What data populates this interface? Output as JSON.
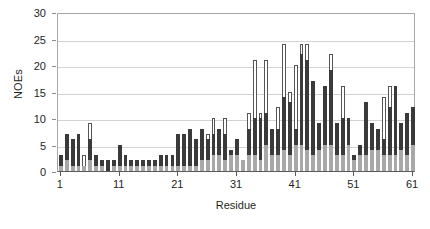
{
  "chart_data": {
    "type": "bar",
    "subtype": "stacked-bar",
    "title": "",
    "xlabel": "Residue",
    "ylabel": "NOEs",
    "xlim": [
      0.5,
      61.5
    ],
    "ylim": [
      0,
      30
    ],
    "ytick_values": [
      0,
      5,
      10,
      15,
      20,
      25,
      30
    ],
    "ytick_labels": [
      "0",
      "5",
      "10",
      "15",
      "20",
      "25",
      "30"
    ],
    "xtick_values": [
      1,
      11,
      21,
      31,
      41,
      51,
      61
    ],
    "xtick_labels": [
      "1",
      "11",
      "21",
      "31",
      "41",
      "51",
      "61"
    ],
    "grid": "horizontal",
    "legend": "none",
    "categories": [
      1,
      2,
      3,
      4,
      5,
      6,
      7,
      8,
      9,
      10,
      11,
      12,
      13,
      14,
      15,
      16,
      17,
      18,
      19,
      20,
      21,
      22,
      23,
      24,
      25,
      26,
      27,
      28,
      29,
      30,
      31,
      32,
      33,
      34,
      35,
      36,
      37,
      38,
      39,
      40,
      41,
      42,
      43,
      44,
      45,
      46,
      47,
      48,
      49,
      50,
      51,
      52,
      53,
      54,
      55,
      56,
      57,
      58,
      59,
      60,
      61
    ],
    "series": [
      {
        "name": "intraresidue",
        "color": "#a8a8a8",
        "values": [
          1,
          2,
          1,
          1,
          1,
          2,
          1,
          1,
          0,
          1,
          1,
          1,
          1,
          1,
          1,
          1,
          1,
          1,
          1,
          1,
          1,
          1,
          1,
          1,
          2,
          2,
          3,
          3,
          2,
          3,
          3,
          2,
          3,
          3,
          2,
          5,
          3,
          3,
          4,
          3,
          5,
          5,
          4,
          3,
          4,
          5,
          5,
          3,
          3,
          5,
          2,
          3,
          3,
          4,
          4,
          3,
          3,
          3,
          4,
          3,
          5
        ]
      },
      {
        "name": "sequential",
        "color": "#3a3a3a",
        "values": [
          2,
          5,
          5,
          6,
          0,
          4,
          2,
          1,
          2,
          1,
          4,
          2,
          1,
          1,
          1,
          1,
          1,
          2,
          2,
          2,
          6,
          6,
          7,
          5,
          6,
          4,
          4,
          5,
          5,
          1,
          3,
          0,
          5,
          7,
          8,
          6,
          5,
          5,
          10,
          10,
          3,
          17,
          17,
          14,
          5,
          11,
          14,
          6,
          7,
          5,
          1,
          2,
          10,
          5,
          4,
          3,
          9,
          13,
          5,
          8,
          7
        ]
      },
      {
        "name": "long-range",
        "color": "#ffffff",
        "values": [
          0,
          0,
          0,
          0,
          2,
          3,
          0,
          0,
          0,
          0,
          0,
          0,
          0,
          0,
          0,
          0,
          0,
          0,
          0,
          0,
          0,
          0,
          0,
          0,
          0,
          1,
          3,
          0,
          3,
          0,
          0,
          0,
          3,
          11,
          1,
          10,
          0,
          4,
          10,
          2,
          12,
          2,
          3,
          0,
          0,
          0,
          3,
          0,
          6,
          0,
          0,
          0,
          0,
          0,
          0,
          8,
          4,
          0,
          0,
          0,
          0
        ]
      }
    ],
    "totals": [
      3,
      7,
      6,
      7,
      3,
      9,
      3,
      2,
      2,
      2,
      5,
      3,
      2,
      2,
      2,
      2,
      2,
      3,
      3,
      3,
      7,
      7,
      8,
      6,
      8,
      7,
      10,
      8,
      10,
      4,
      6,
      2,
      11,
      21,
      11,
      21,
      8,
      12,
      24,
      15,
      20,
      24,
      24,
      17,
      9,
      16,
      22,
      9,
      16,
      10,
      3,
      5,
      13,
      9,
      8,
      14,
      16,
      16,
      9,
      11,
      12
    ]
  }
}
